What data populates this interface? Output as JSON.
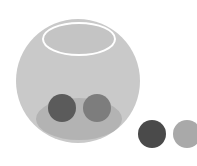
{
  "canvas": {
    "width": 197,
    "height": 166,
    "background": "#ffffff"
  },
  "bowl": {
    "sphere": {
      "cx": 78,
      "cy": 81,
      "r": 62,
      "color": "#c9c9c9"
    },
    "opening": {
      "cx": 79,
      "cy": 39,
      "rx": 36,
      "ry": 16,
      "fill": "#c4c4c4",
      "stroke": "#ffffff",
      "stroke_width": 2
    },
    "base_shadow": {
      "cx": 79,
      "cy": 119,
      "rx": 43,
      "ry": 21,
      "color": "#b3b3b3"
    }
  },
  "balls_inside": [
    {
      "cx": 62,
      "cy": 108,
      "r": 14,
      "color": "#5b5b5b"
    },
    {
      "cx": 97,
      "cy": 108,
      "r": 14,
      "color": "#7d7d7d"
    }
  ],
  "balls_outside": [
    {
      "cx": 152,
      "cy": 134,
      "r": 14,
      "color": "#4a4a4a"
    },
    {
      "cx": 187,
      "cy": 134,
      "r": 14,
      "color": "#a9a9a9"
    }
  ]
}
